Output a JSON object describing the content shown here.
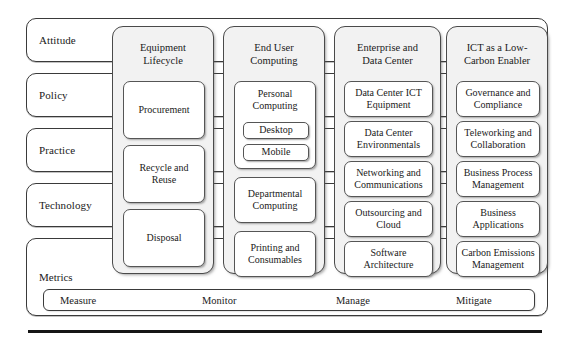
{
  "diagram": {
    "rows": [
      {
        "label": "Attitude"
      },
      {
        "label": "Policy"
      },
      {
        "label": "Practice"
      },
      {
        "label": "Technology"
      }
    ],
    "metrics": {
      "title": "Metrics",
      "stages": [
        "Measure",
        "Monitor",
        "Manage",
        "Mitigate"
      ]
    },
    "pillars": [
      {
        "title": "Equipment Lifecycle",
        "title_line1": "Equipment",
        "title_line2": "Lifecycle",
        "items": [
          {
            "label": "Procurement"
          },
          {
            "label": "Recycle and Reuse"
          },
          {
            "label": "Disposal"
          }
        ]
      },
      {
        "title": "End User Computing",
        "title_line1": "End User",
        "title_line2": "Computing",
        "items": [
          {
            "label": "Personal Computing",
            "subitems": [
              {
                "label": "Desktop"
              },
              {
                "label": "Mobile"
              }
            ]
          },
          {
            "label": "Departmental Computing"
          },
          {
            "label": "Printing and Consumables"
          }
        ]
      },
      {
        "title": "Enterprise and Data Center",
        "title_line1": "Enterprise and",
        "title_line2": "Data Center",
        "items": [
          {
            "label": "Data Center ICT Equipment"
          },
          {
            "label": "Data Center Environmentals"
          },
          {
            "label": "Networking and Communications"
          },
          {
            "label": "Outsourcing and Cloud"
          },
          {
            "label": "Software Architecture"
          }
        ]
      },
      {
        "title": "ICT as a Low-Carbon Enabler",
        "title_line1": "ICT as a Low-",
        "title_line2": "Carbon Enabler",
        "items": [
          {
            "label": "Governance and Compliance"
          },
          {
            "label": "Teleworking and Collaboration"
          },
          {
            "label": "Business Process Management"
          },
          {
            "label": "Business Applications"
          },
          {
            "label": "Carbon Emissions Management"
          }
        ]
      }
    ],
    "colors": {
      "pillar_fill": "#f2f2f2",
      "card_fill": "#ffffff",
      "outline": "#4a4a4a",
      "text": "#1a1a1a",
      "rule": "#151515"
    }
  }
}
